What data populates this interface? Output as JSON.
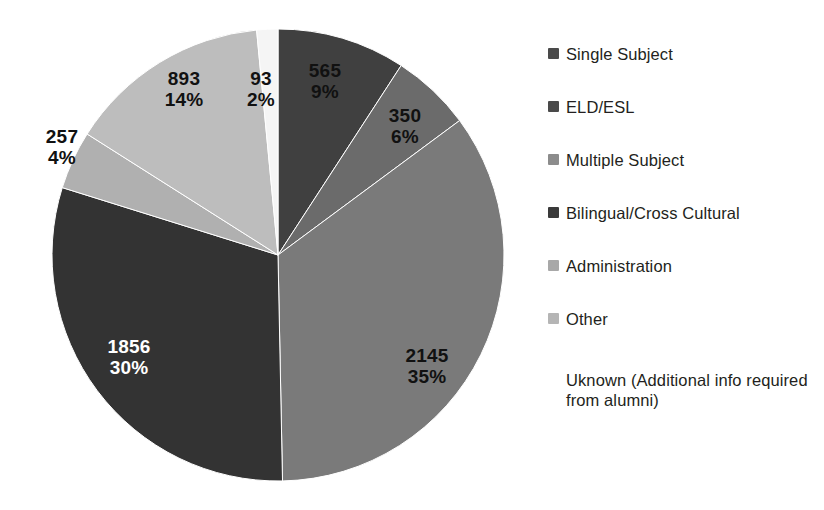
{
  "chart_data": {
    "type": "pie",
    "title": "",
    "subtitle": "",
    "xlabel": "",
    "ylabel": "",
    "total": 6159,
    "start_angle_deg": 0,
    "direction": "clockwise",
    "legend_position": "right",
    "grid": false,
    "categories": [
      "Single Subject",
      "ELD/ESL",
      "Multiple Subject",
      "Bilingual/Cross Cultural",
      "Administration",
      "Other",
      "Uknown (Additional info required from alumni)"
    ],
    "values": [
      565,
      350,
      2145,
      1856,
      257,
      893,
      93
    ],
    "percents": [
      9,
      6,
      35,
      30,
      4,
      14,
      2
    ],
    "value_labels": [
      "565",
      "350",
      "2145",
      "1856",
      "257",
      "893",
      "93"
    ],
    "percent_labels": [
      "9%",
      "6%",
      "35%",
      "30%",
      "4%",
      "14%",
      "2%"
    ],
    "colors": [
      "#404040",
      "#6b6b6b",
      "#7a7a7a",
      "#333333",
      "#b0b0b0",
      "#bdbdbd",
      "#f5f5f5"
    ],
    "slices": [
      {
        "label": "Single Subject",
        "value": "565",
        "percent": "9%",
        "color": "#404040",
        "label_color": "dark",
        "label_x": 310,
        "label_y": 48,
        "label_inside": true
      },
      {
        "label": "ELD/ESL",
        "value": "350",
        "percent": "6%",
        "color": "#6b6b6b",
        "label_color": "dark",
        "label_x": 389,
        "label_y": 93,
        "label_inside": true
      },
      {
        "label": "Multiple Subject",
        "value": "2145",
        "percent": "35%",
        "color": "#7a7a7a",
        "label_color": "dark",
        "label_x": 410,
        "label_y": 334,
        "label_inside": true
      },
      {
        "label": "Bilingual/Cross Cultural",
        "value": "1856",
        "percent": "30%",
        "color": "#333333",
        "label_color": "light",
        "label_x": 105,
        "label_y": 325,
        "label_inside": true
      },
      {
        "label": "Administration",
        "value": "257",
        "percent": "4%",
        "color": "#b0b0b0",
        "label_color": "dark",
        "label_x": 33,
        "label_y": 118,
        "label_inside": false
      },
      {
        "label": "Other",
        "value": "893",
        "percent": "14%",
        "color": "#bdbdbd",
        "label_color": "dark",
        "label_x": 163,
        "label_y": 61,
        "label_inside": true
      },
      {
        "label": "Uknown",
        "value": "93",
        "percent": "2%",
        "color": "#f5f5f5",
        "label_color": "dark",
        "label_x": 244,
        "label_y": 61,
        "label_inside": false
      }
    ]
  },
  "legend": {
    "items": [
      {
        "label": "Single Subject",
        "color": "#4a4a4a",
        "has_swatch": true
      },
      {
        "label": "ELD/ESL",
        "color": "#4a4a4a",
        "has_swatch": true
      },
      {
        "label": "Multiple Subject",
        "color": "#8c8c8c",
        "has_swatch": true
      },
      {
        "label": "Bilingual/Cross Cultural",
        "color": "#3a3a3a",
        "has_swatch": true
      },
      {
        "label": "Administration",
        "color": "#a8a8a8",
        "has_swatch": true
      },
      {
        "label": "Other",
        "color": "#b5b5b5",
        "has_swatch": true
      }
    ],
    "note": "Uknown (Additional info required from alumni)",
    "note_has_swatch": false
  }
}
